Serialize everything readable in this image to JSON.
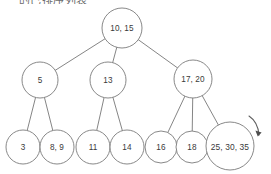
{
  "diagram": {
    "type": "b-tree",
    "title_fragment": "的已排序列表",
    "background_color": "#ffffff",
    "stroke_color": "#777777",
    "text_color": "#3a3a3a",
    "levels": [
      {
        "level": 0,
        "name": "root",
        "nodes": [
          {
            "id": "root",
            "label": "10, 15",
            "cx": 122,
            "cy": 28,
            "r": 20
          }
        ]
      },
      {
        "level": 1,
        "name": "internal",
        "nodes": [
          {
            "id": "n5",
            "label": "5",
            "cx": 40,
            "cy": 80,
            "r": 18
          },
          {
            "id": "n13",
            "label": "13",
            "cx": 108,
            "cy": 80,
            "r": 18
          },
          {
            "id": "n1720",
            "label": "17, 20",
            "cx": 193,
            "cy": 79,
            "r": 19
          }
        ]
      },
      {
        "level": 2,
        "name": "leaves",
        "nodes": [
          {
            "id": "l3",
            "label": "3",
            "cx": 23,
            "cy": 147,
            "r": 17
          },
          {
            "id": "l89",
            "label": "8, 9",
            "cx": 57,
            "cy": 147,
            "r": 17
          },
          {
            "id": "l11",
            "label": "11",
            "cx": 93,
            "cy": 147,
            "r": 17
          },
          {
            "id": "l14",
            "label": "14",
            "cx": 127,
            "cy": 147,
            "r": 17
          },
          {
            "id": "l16",
            "label": "16",
            "cx": 161,
            "cy": 147,
            "r": 16
          },
          {
            "id": "l18",
            "label": "18",
            "cx": 192,
            "cy": 147,
            "r": 16
          },
          {
            "id": "l253035",
            "label": "25, 30, 35",
            "cx": 230,
            "cy": 146,
            "r": 24
          }
        ]
      }
    ],
    "edges": [
      {
        "from": "root",
        "to": "n5"
      },
      {
        "from": "root",
        "to": "n13"
      },
      {
        "from": "root",
        "to": "n1720"
      },
      {
        "from": "n5",
        "to": "l3"
      },
      {
        "from": "n5",
        "to": "l89"
      },
      {
        "from": "n13",
        "to": "l11"
      },
      {
        "from": "n13",
        "to": "l14"
      },
      {
        "from": "n1720",
        "to": "l16"
      },
      {
        "from": "n1720",
        "to": "l18"
      },
      {
        "from": "n1720",
        "to": "l253035"
      }
    ],
    "annotation": {
      "name": "curved-arrow",
      "description": "curved arrow pointing down-right",
      "start_x": 249,
      "start_y": 116,
      "end_x": 259,
      "end_y": 135
    }
  }
}
